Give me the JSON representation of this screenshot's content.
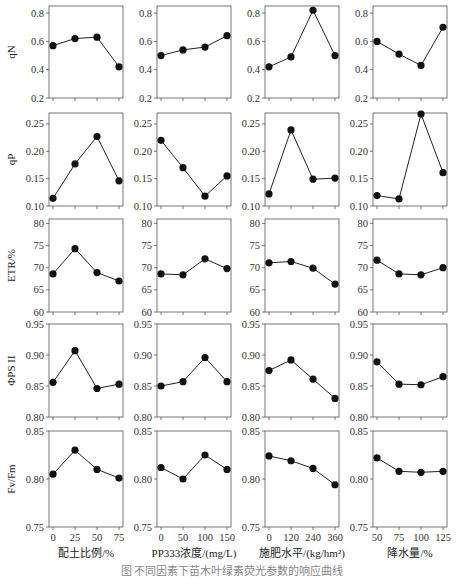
{
  "figure": {
    "caption": "图  不同因素下苗木叶绿素荧光参数的响应曲线",
    "columns": [
      {
        "xlabel": "配土比例/%",
        "xticks": [
          "0",
          "25",
          "50",
          "75"
        ]
      },
      {
        "xlabel": "PP333浓度/(mg/L)",
        "xticks": [
          "0",
          "50",
          "100",
          "150"
        ]
      },
      {
        "xlabel": "施肥水平/(kg/hm²)",
        "xticks": [
          "0",
          "120",
          "240",
          "360"
        ]
      },
      {
        "xlabel": "降水量/%",
        "xticks": [
          "50",
          "75",
          "100",
          "125"
        ]
      }
    ],
    "rows": [
      {
        "ylabel": "qN",
        "ylim": [
          0.2,
          0.85
        ],
        "yticks": [
          0.2,
          0.4,
          0.6,
          0.8
        ],
        "tick_fmt": 1
      },
      {
        "ylabel": "qP",
        "ylim": [
          0.1,
          0.27
        ],
        "yticks": [
          0.1,
          0.15,
          0.2,
          0.25
        ],
        "tick_fmt": 2
      },
      {
        "ylabel": "ETR/%",
        "ylim": [
          60,
          81
        ],
        "yticks": [
          60,
          65,
          70,
          75,
          80
        ],
        "tick_fmt": 0
      },
      {
        "ylabel": "ΦPS II",
        "ylim": [
          0.8,
          0.95
        ],
        "yticks": [
          0.8,
          0.85,
          0.9,
          0.95
        ],
        "tick_fmt": 2
      },
      {
        "ylabel": "Fv/Fm",
        "ylim": [
          0.75,
          0.85
        ],
        "yticks": [
          0.75,
          0.8,
          0.85
        ],
        "tick_fmt": 2
      }
    ]
  },
  "chart_data": [
    {
      "type": "line",
      "row": "qN",
      "xlabel": "配土比例/%",
      "x": [
        0,
        25,
        50,
        75
      ],
      "values": [
        0.57,
        0.62,
        0.63,
        0.42
      ],
      "ylim": [
        0.2,
        0.85
      ]
    },
    {
      "type": "line",
      "row": "qN",
      "xlabel": "PP333浓度/(mg/L)",
      "x": [
        0,
        50,
        100,
        150
      ],
      "values": [
        0.5,
        0.54,
        0.56,
        0.64
      ],
      "ylim": [
        0.2,
        0.85
      ]
    },
    {
      "type": "line",
      "row": "qN",
      "xlabel": "施肥水平/(kg/hm²)",
      "x": [
        0,
        120,
        240,
        360
      ],
      "values": [
        0.42,
        0.49,
        0.82,
        0.5
      ],
      "ylim": [
        0.2,
        0.85
      ]
    },
    {
      "type": "line",
      "row": "qN",
      "xlabel": "降水量/%",
      "x": [
        50,
        75,
        100,
        125
      ],
      "values": [
        0.6,
        0.51,
        0.43,
        0.7
      ],
      "ylim": [
        0.2,
        0.85
      ]
    },
    {
      "type": "line",
      "row": "qP",
      "xlabel": "配土比例/%",
      "x": [
        0,
        25,
        50,
        75
      ],
      "values": [
        0.114,
        0.177,
        0.227,
        0.146
      ],
      "ylim": [
        0.1,
        0.27
      ]
    },
    {
      "type": "line",
      "row": "qP",
      "xlabel": "PP333浓度/(mg/L)",
      "x": [
        0,
        50,
        100,
        150
      ],
      "values": [
        0.22,
        0.17,
        0.118,
        0.155
      ],
      "ylim": [
        0.1,
        0.27
      ]
    },
    {
      "type": "line",
      "row": "qP",
      "xlabel": "施肥水平/(kg/hm²)",
      "x": [
        0,
        120,
        240,
        360
      ],
      "values": [
        0.122,
        0.239,
        0.149,
        0.151
      ],
      "ylim": [
        0.1,
        0.27
      ]
    },
    {
      "type": "line",
      "row": "qP",
      "xlabel": "降水量/%",
      "x": [
        50,
        75,
        100,
        125
      ],
      "values": [
        0.119,
        0.113,
        0.268,
        0.161
      ],
      "ylim": [
        0.1,
        0.27
      ]
    },
    {
      "type": "line",
      "row": "ETR/%",
      "xlabel": "配土比例/%",
      "x": [
        0,
        25,
        50,
        75
      ],
      "values": [
        68.6,
        74.3,
        68.9,
        67.0
      ],
      "ylim": [
        60,
        81
      ]
    },
    {
      "type": "line",
      "row": "ETR/%",
      "xlabel": "PP333浓度/(mg/L)",
      "x": [
        0,
        50,
        100,
        150
      ],
      "values": [
        68.6,
        68.4,
        72.0,
        69.8
      ],
      "ylim": [
        60,
        81
      ]
    },
    {
      "type": "line",
      "row": "ETR/%",
      "xlabel": "施肥水平/(kg/hm²)",
      "x": [
        0,
        120,
        240,
        360
      ],
      "values": [
        71.1,
        71.4,
        69.9,
        66.3
      ],
      "ylim": [
        60,
        81
      ]
    },
    {
      "type": "line",
      "row": "ETR/%",
      "xlabel": "降水量/%",
      "x": [
        50,
        75,
        100,
        125
      ],
      "values": [
        71.7,
        68.6,
        68.4,
        70.0
      ],
      "ylim": [
        60,
        81
      ]
    },
    {
      "type": "line",
      "row": "ΦPS II",
      "xlabel": "配土比例/%",
      "x": [
        0,
        25,
        50,
        75
      ],
      "values": [
        0.856,
        0.907,
        0.846,
        0.853
      ],
      "ylim": [
        0.8,
        0.95
      ]
    },
    {
      "type": "line",
      "row": "ΦPS II",
      "xlabel": "PP333浓度/(mg/L)",
      "x": [
        0,
        50,
        100,
        150
      ],
      "values": [
        0.85,
        0.857,
        0.896,
        0.857
      ],
      "ylim": [
        0.8,
        0.95
      ]
    },
    {
      "type": "line",
      "row": "ΦPS II",
      "xlabel": "施肥水平/(kg/hm²)",
      "x": [
        0,
        120,
        240,
        360
      ],
      "values": [
        0.875,
        0.892,
        0.861,
        0.83
      ],
      "ylim": [
        0.8,
        0.95
      ]
    },
    {
      "type": "line",
      "row": "ΦPS II",
      "xlabel": "降水量/%",
      "x": [
        50,
        75,
        100,
        125
      ],
      "values": [
        0.889,
        0.853,
        0.852,
        0.865
      ],
      "ylim": [
        0.8,
        0.95
      ]
    },
    {
      "type": "line",
      "row": "Fv/Fm",
      "xlabel": "配土比例/%",
      "x": [
        0,
        25,
        50,
        75
      ],
      "values": [
        0.805,
        0.83,
        0.81,
        0.801
      ],
      "ylim": [
        0.75,
        0.85
      ]
    },
    {
      "type": "line",
      "row": "Fv/Fm",
      "xlabel": "PP333浓度/(mg/L)",
      "x": [
        0,
        50,
        100,
        150
      ],
      "values": [
        0.812,
        0.8,
        0.825,
        0.81
      ],
      "ylim": [
        0.75,
        0.85
      ]
    },
    {
      "type": "line",
      "row": "Fv/Fm",
      "xlabel": "施肥水平/(kg/hm²)",
      "x": [
        0,
        120,
        240,
        360
      ],
      "values": [
        0.824,
        0.819,
        0.811,
        0.794
      ],
      "ylim": [
        0.75,
        0.85
      ]
    },
    {
      "type": "line",
      "row": "Fv/Fm",
      "xlabel": "降水量/%",
      "x": [
        50,
        75,
        100,
        125
      ],
      "values": [
        0.822,
        0.808,
        0.807,
        0.808
      ],
      "ylim": [
        0.75,
        0.85
      ]
    }
  ]
}
